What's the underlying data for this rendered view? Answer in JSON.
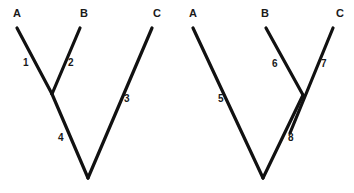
{
  "figure": {
    "background_color": "#ffffff",
    "line_color": "#111111",
    "text_color": "#1a1a1a",
    "width": 354,
    "height": 193
  },
  "trees": [
    {
      "id": "left-tree",
      "taxa": [
        {
          "label": "A",
          "x": 13,
          "y": 8
        },
        {
          "label": "B",
          "x": 80,
          "y": 8
        },
        {
          "label": "C",
          "x": 153,
          "y": 8
        }
      ],
      "branches": [
        {
          "label": "1",
          "x1": 17,
          "y1": 28,
          "x2": 52,
          "y2": 94,
          "lx": 23,
          "ly": 58
        },
        {
          "label": "2",
          "x1": 80,
          "y1": 28,
          "x2": 52,
          "y2": 94,
          "lx": 68,
          "ly": 58
        },
        {
          "label": "3",
          "x1": 152,
          "y1": 28,
          "x2": 88,
          "y2": 178,
          "lx": 124,
          "ly": 94
        },
        {
          "label": "4",
          "x1": 52,
          "y1": 94,
          "x2": 88,
          "y2": 178,
          "lx": 58,
          "ly": 133
        }
      ],
      "nodes": [
        {
          "name": "internal-node-ab",
          "x": 52,
          "y": 94
        },
        {
          "name": "root-node",
          "x": 88,
          "y": 178
        }
      ]
    },
    {
      "id": "right-tree",
      "taxa": [
        {
          "label": "A",
          "x": 189,
          "y": 8
        },
        {
          "label": "B",
          "x": 261,
          "y": 8
        },
        {
          "label": "C",
          "x": 336,
          "y": 8
        }
      ],
      "branches": [
        {
          "label": "5",
          "x1": 193,
          "y1": 28,
          "x2": 263,
          "y2": 178,
          "lx": 218,
          "ly": 94
        },
        {
          "label": "6",
          "x1": 266,
          "y1": 28,
          "x2": 303,
          "y2": 95,
          "lx": 272,
          "ly": 59
        },
        {
          "label": "7",
          "x1": 333,
          "y1": 28,
          "x2": 290,
          "y2": 133,
          "lx": 321,
          "ly": 59
        },
        {
          "label": "8",
          "x1": 303,
          "y1": 95,
          "x2": 263,
          "y2": 178,
          "lx": 288,
          "ly": 133
        }
      ],
      "nodes": [
        {
          "name": "internal-node-bc",
          "x": 303,
          "y": 95
        },
        {
          "name": "root-node",
          "x": 263,
          "y": 178
        }
      ]
    }
  ]
}
